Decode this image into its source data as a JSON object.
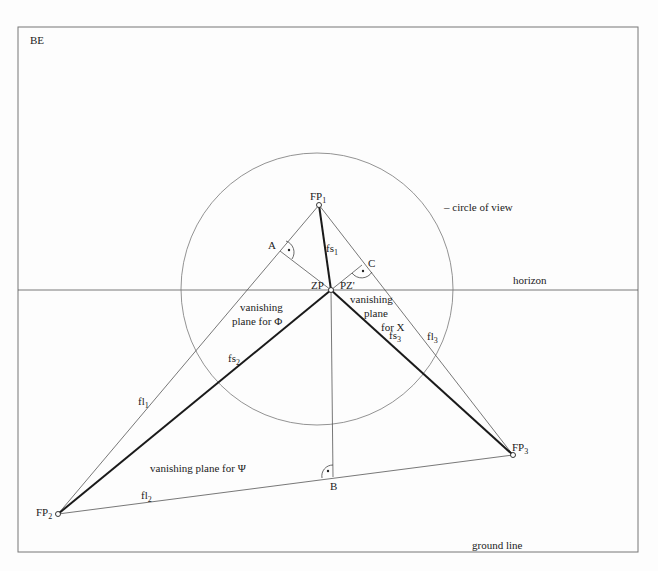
{
  "frame_label": "BE",
  "labels": {
    "fp1": "FP",
    "fp1_sub": "1",
    "fp2": "FP",
    "fp2_sub": "2",
    "fp3": "FP",
    "fp3_sub": "3",
    "zp": "ZP",
    "pz": "PZ'",
    "a": "A",
    "b": "B",
    "c": "C",
    "fs1": "fs",
    "fs1_sub": "1",
    "fs2": "fs",
    "fs2_sub": "2",
    "fs3": "fs",
    "fs3_sub": "3",
    "fl1": "fl",
    "fl1_sub": "1",
    "fl2": "fl",
    "fl2_sub": "2",
    "fl3": "fl",
    "fl3_sub": "3",
    "circle_of_view": "– circle of view",
    "horizon": "horizon",
    "ground_line": "ground line",
    "plane_phi_1": "vanishing",
    "plane_phi_2": "plane for Φ",
    "plane_x_1": "vanishing",
    "plane_x_2": "plane",
    "plane_x_3": "for X",
    "plane_psi": "vanishing plane for Ψ"
  },
  "colors": {
    "thin_line": "#555555",
    "thick_line": "#1a1a1a",
    "frame": "#666666"
  }
}
